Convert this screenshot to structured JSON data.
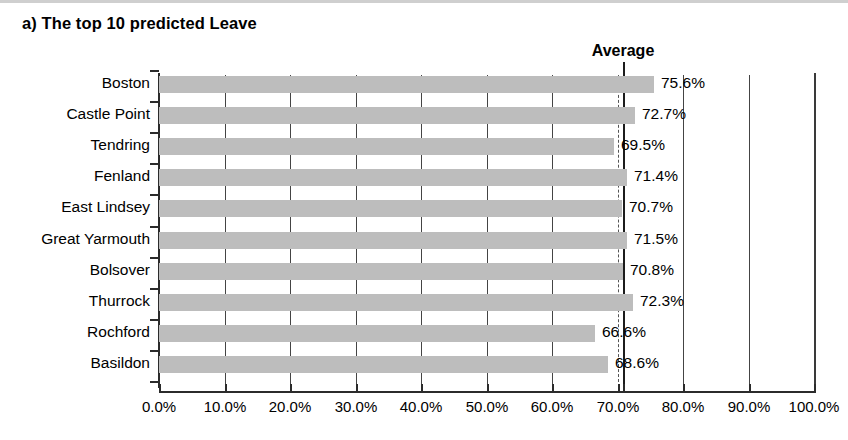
{
  "figure": {
    "panel_label": "a) The top 10 predicted Leave",
    "average_annotation": "Average"
  },
  "chart_data": {
    "type": "bar",
    "orientation": "horizontal",
    "title": "a) The top 10 predicted Leave",
    "xlabel": "",
    "ylabel": "",
    "xlim": [
      0,
      100
    ],
    "xunit": "%",
    "grid": true,
    "legend": null,
    "categories": [
      "Boston",
      "Castle Point",
      "Tendring",
      "Fenland",
      "East Lindsey",
      "Great Yarmouth",
      "Bolsover",
      "Thurrock",
      "Rochford",
      "Basildon"
    ],
    "values": [
      75.6,
      72.7,
      69.5,
      71.4,
      70.7,
      71.5,
      70.8,
      72.3,
      66.6,
      68.6
    ],
    "value_labels": [
      "75.6%",
      "72.7%",
      "69.5%",
      "71.4%",
      "70.7%",
      "71.5%",
      "70.8%",
      "72.3%",
      "66.6%",
      "68.6%"
    ],
    "xticks": [
      0,
      10,
      20,
      30,
      40,
      50,
      60,
      70,
      80,
      90,
      100
    ],
    "xticklabels": [
      "0.0%",
      "10.0%",
      "20.0%",
      "30.0%",
      "40.0%",
      "50.0%",
      "60.0%",
      "70.0%",
      "80.0%",
      "90.0%",
      "100.0%"
    ],
    "annotations": [
      {
        "label": "Average",
        "type": "vertical-line",
        "value": 70.9
      }
    ],
    "colors": {
      "bar": "#bdbdbd",
      "axis": "#2b2b2b",
      "gridline": "#444444",
      "average_line": "#1c1c1c",
      "text": "#000000",
      "background": "#ffffff"
    }
  }
}
